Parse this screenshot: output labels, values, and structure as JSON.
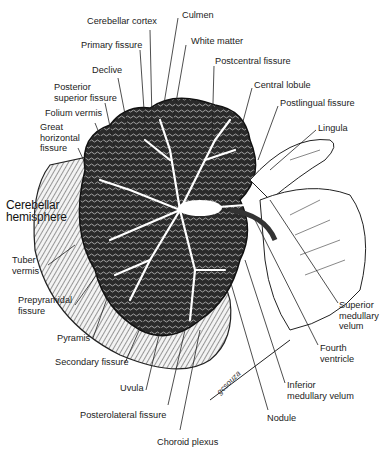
{
  "figure": {
    "signature": "gcsouza",
    "labels": [
      {
        "id": "cerebellar-cortex",
        "text": "Cerebellar cortex",
        "x": 87,
        "y": 16
      },
      {
        "id": "culmen",
        "text": "Culmen",
        "x": 182,
        "y": 10
      },
      {
        "id": "primary-fissure",
        "text": "Primary fissure",
        "x": 81,
        "y": 40
      },
      {
        "id": "white-matter",
        "text": "White matter",
        "x": 191,
        "y": 36
      },
      {
        "id": "declive",
        "text": "Declive",
        "x": 92,
        "y": 65
      },
      {
        "id": "postcentral-fissure",
        "text": "Postcentral fissure",
        "x": 215,
        "y": 56
      },
      {
        "id": "posterior-superior-fissure",
        "text": "Posterior\nsuperior fissure",
        "x": 54,
        "y": 82
      },
      {
        "id": "central-lobule",
        "text": "Central lobule",
        "x": 254,
        "y": 80
      },
      {
        "id": "postlingual-fissure",
        "text": "Postlingual fissure",
        "x": 280,
        "y": 98
      },
      {
        "id": "folium-vermis",
        "text": "Folium vermis",
        "x": 45,
        "y": 108
      },
      {
        "id": "lingula",
        "text": "Lingula",
        "x": 318,
        "y": 123
      },
      {
        "id": "great-horizontal-fissure",
        "text": "Great\nhorizontal\nfissure",
        "x": 40,
        "y": 122
      },
      {
        "id": "cerebellar-hemisphere",
        "text": "Cerebellar\nhemisphere",
        "x": 6,
        "y": 199,
        "big": true
      },
      {
        "id": "tuber-vermis",
        "text": "Tuber\nvermis",
        "x": 12,
        "y": 255
      },
      {
        "id": "prepyramidal-fissure",
        "text": "Prepyramidal\nfissure",
        "x": 18,
        "y": 295
      },
      {
        "id": "superior-medullary-velum",
        "text": "Superior\nmedullary\nvelum",
        "x": 339,
        "y": 300
      },
      {
        "id": "pyramis",
        "text": "Pyramis",
        "x": 57,
        "y": 333
      },
      {
        "id": "fourth-ventricle",
        "text": "Fourth\nventricle",
        "x": 320,
        "y": 343
      },
      {
        "id": "secondary-fissure",
        "text": "Secondary fissure",
        "x": 55,
        "y": 357
      },
      {
        "id": "uvula",
        "text": "Uvula",
        "x": 120,
        "y": 383
      },
      {
        "id": "inferior-medullary-velum",
        "text": "Inferior\nmedullary velum",
        "x": 287,
        "y": 380
      },
      {
        "id": "posterolateral-fissure",
        "text": "Posterolateral fissure",
        "x": 80,
        "y": 410
      },
      {
        "id": "nodule",
        "text": "Nodule",
        "x": 267,
        "y": 413
      },
      {
        "id": "choroid-plexus",
        "text": "Choroid plexus",
        "x": 157,
        "y": 437
      }
    ]
  }
}
